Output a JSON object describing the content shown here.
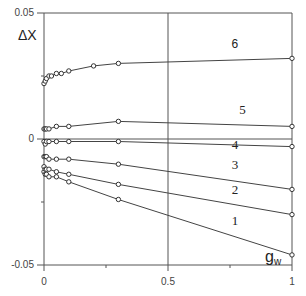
{
  "chart_data": {
    "type": "line",
    "title": "",
    "xlabel": "g_w",
    "ylabel": "ΔX",
    "xlim": [
      0,
      1
    ],
    "ylim": [
      -0.05,
      0.05
    ],
    "x_ticks": [
      "0",
      "0.5",
      "1"
    ],
    "y_ticks": [
      "0.05",
      "0",
      "-0.05"
    ],
    "grid": false,
    "reference_lines": {
      "x": 0.5,
      "y": 0
    },
    "legend": "inline curve numbers",
    "series": [
      {
        "name": "1",
        "x": [
          0,
          0.005,
          0.01,
          0.02,
          0.05,
          0.1,
          0.3,
          1
        ],
        "y": [
          -0.013,
          -0.014,
          -0.014,
          -0.015,
          -0.015,
          -0.017,
          -0.024,
          -0.046
        ]
      },
      {
        "name": "2",
        "x": [
          0,
          0.005,
          0.01,
          0.02,
          0.05,
          0.1,
          0.3,
          1
        ],
        "y": [
          -0.011,
          -0.012,
          -0.012,
          -0.012,
          -0.013,
          -0.014,
          -0.018,
          -0.03
        ]
      },
      {
        "name": "3",
        "x": [
          0,
          0.005,
          0.01,
          0.02,
          0.05,
          0.1,
          0.3,
          1
        ],
        "y": [
          -0.007,
          -0.007,
          -0.007,
          -0.008,
          -0.008,
          -0.008,
          -0.01,
          -0.02
        ]
      },
      {
        "name": "4",
        "x": [
          0,
          0.005,
          0.01,
          0.02,
          0.05,
          0.1,
          0.3,
          1
        ],
        "y": [
          -0.001,
          -0.002,
          -0.001,
          -0.001,
          -0.001,
          -0.001,
          -0.001,
          -0.003
        ]
      },
      {
        "name": "5",
        "x": [
          0,
          0.005,
          0.01,
          0.02,
          0.05,
          0.1,
          0.3,
          1
        ],
        "y": [
          0.004,
          0.004,
          0.004,
          0.004,
          0.005,
          0.005,
          0.007,
          0.005
        ]
      },
      {
        "name": "6",
        "x": [
          0,
          0.005,
          0.01,
          0.02,
          0.03,
          0.05,
          0.07,
          0.1,
          0.2,
          0.3,
          1
        ],
        "y": [
          0.022,
          0.023,
          0.024,
          0.025,
          0.025,
          0.026,
          0.026,
          0.027,
          0.029,
          0.03,
          0.032
        ]
      }
    ],
    "curve_labels": [
      {
        "text": "1",
        "x": 0.77,
        "y": -0.034
      },
      {
        "text": "2",
        "x": 0.77,
        "y": -0.022
      },
      {
        "text": "3",
        "x": 0.77,
        "y": -0.012
      },
      {
        "text": "4",
        "x": 0.77,
        "y": -0.004
      },
      {
        "text": "5",
        "x": 0.8,
        "y": 0.01
      },
      {
        "text": "6",
        "x": 0.77,
        "y": 0.036
      }
    ]
  }
}
